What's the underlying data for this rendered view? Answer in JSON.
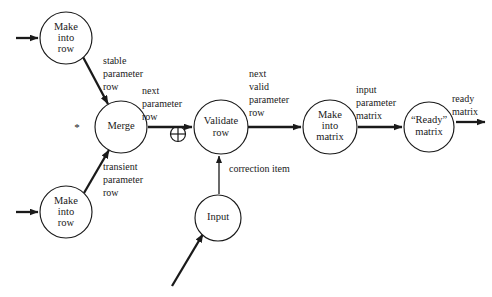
{
  "diagram": {
    "background_color": "#ffffff",
    "ink_color": "#1a1a1a",
    "nodes": [
      {
        "id": "make-into-row-top",
        "lines": [
          "Make",
          "into",
          "row"
        ],
        "line1": "Make",
        "line2": "into",
        "line3": "row",
        "cx": 66,
        "cy": 38,
        "r": 26
      },
      {
        "id": "merge",
        "lines": [
          "Merge"
        ],
        "line1": "Merge",
        "cx": 121,
        "cy": 127,
        "r": 26
      },
      {
        "id": "make-into-row-bottom",
        "lines": [
          "Make",
          "into",
          "row"
        ],
        "line1": "Make",
        "line2": "into",
        "line3": "row",
        "cx": 66,
        "cy": 212,
        "r": 26
      },
      {
        "id": "validate-row",
        "lines": [
          "Validate",
          "row"
        ],
        "line1": "Validate",
        "line2": "row",
        "cx": 221,
        "cy": 127,
        "r": 27
      },
      {
        "id": "input",
        "lines": [
          "Input"
        ],
        "line1": "Input",
        "cx": 218,
        "cy": 218,
        "r": 23
      },
      {
        "id": "make-into-matrix",
        "lines": [
          "Make",
          "into",
          "matrix"
        ],
        "line1": "Make",
        "line2": "into",
        "line3": "matrix",
        "cx": 330,
        "cy": 127,
        "r": 27
      },
      {
        "id": "ready-matrix",
        "lines": [
          "“Ready”",
          "matrix"
        ],
        "line1": "“Ready”",
        "line2": "matrix",
        "cx": 429,
        "cy": 127,
        "r": 25
      }
    ],
    "edge_labels": {
      "stable_parameter_row": {
        "line1": "stable",
        "line2": "parameter",
        "line3": "row",
        "x": 103,
        "y": 63
      },
      "transient_parameter_row": {
        "line1": "transient",
        "line2": "parameter",
        "line3": "row",
        "x": 103,
        "y": 168
      },
      "next_parameter_row": {
        "line1": "next",
        "line2": "parameter",
        "line3": "row",
        "x": 141,
        "y": 90
      },
      "next_valid_parameter_row": {
        "line1": "next",
        "line2": "valid",
        "line3": "parameter",
        "line4": "row",
        "x": 248,
        "y": 72
      },
      "input_parameter_matrix": {
        "line1": "input",
        "line2": "parameter",
        "line3": "matrix",
        "x": 355,
        "y": 88
      },
      "ready_matrix": {
        "line1": "ready",
        "line2": "matrix",
        "x": 452,
        "y": 98
      },
      "correction_item": {
        "line1": "correction item",
        "x": 229,
        "y": 170
      }
    },
    "symbols": {
      "merge_star": {
        "glyph": "*",
        "x": 77,
        "y": 127
      },
      "adder": {
        "glyph": "⊕",
        "cx": 178,
        "cy": 134,
        "r": 7.5
      }
    },
    "external_arrows": [
      {
        "id": "input-arrow-top",
        "x1": 16,
        "y1": 38,
        "x2": 38,
        "y2": 38
      },
      {
        "id": "input-arrow-bottom",
        "x1": 16,
        "y1": 212,
        "x2": 38,
        "y2": 212
      },
      {
        "id": "input-arrow-diagonal",
        "x1": 173,
        "y1": 285,
        "x2": 202,
        "y2": 235
      },
      {
        "id": "output-arrow-right",
        "x1": 455,
        "y1": 122,
        "x2": 484,
        "y2": 122
      }
    ]
  }
}
